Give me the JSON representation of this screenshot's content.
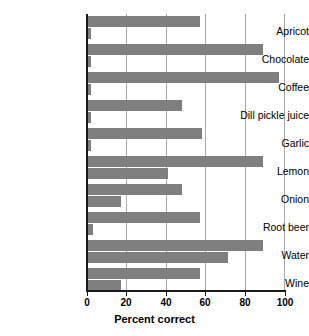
{
  "chart_data": {
    "type": "bar",
    "orientation": "horizontal",
    "title": "",
    "xlabel": "Percent correct",
    "ylabel": "",
    "xlim": [
      0,
      100
    ],
    "xticks": [
      0,
      20,
      40,
      60,
      80,
      100
    ],
    "grid": true,
    "gridlines_axis": "x",
    "legend": null,
    "bar_color": "#7f7f7f",
    "categories": [
      "Apricot",
      "Chocolate",
      "Coffee",
      "Dill pickle juice",
      "Garlic",
      "Lemon",
      "Onion",
      "Root beer",
      "Water",
      "Wine"
    ],
    "series": [
      {
        "name": "upper",
        "values": [
          57,
          89,
          97,
          48,
          58,
          89,
          48,
          57,
          89,
          57
        ]
      },
      {
        "name": "lower",
        "values": [
          2,
          2,
          2,
          2,
          2,
          41,
          17,
          3,
          71,
          17
        ]
      }
    ]
  },
  "axis": {
    "tick_labels": [
      "0",
      "20",
      "40",
      "60",
      "80",
      "100"
    ],
    "x_axis_title": "Percent correct"
  }
}
